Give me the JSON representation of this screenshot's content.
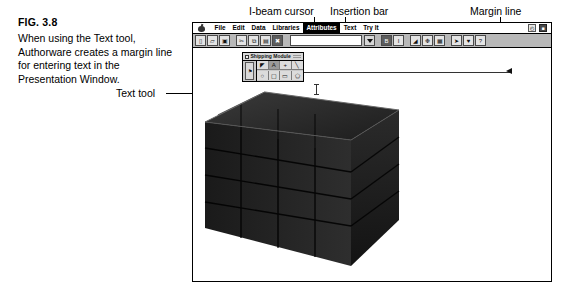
{
  "figure": {
    "label": "FIG. 3.8",
    "caption": "When using the Text tool, Authorware creates a margin line for entering text in the Presentation Window."
  },
  "callouts": {
    "text_tool": "Text tool",
    "ibeam_cursor": "I-beam cursor",
    "insertion_bar": "Insertion bar",
    "margin_line": "Margin line"
  },
  "app": {
    "menus": [
      {
        "label": "File",
        "selected": false
      },
      {
        "label": "Edit",
        "selected": false
      },
      {
        "label": "Data",
        "selected": false
      },
      {
        "label": "Libraries",
        "selected": false
      },
      {
        "label": "Attributes",
        "selected": true
      },
      {
        "label": "Text",
        "selected": false
      },
      {
        "label": "Try It",
        "selected": false
      }
    ],
    "apple_menu_icon": "apple-icon",
    "menu_right_icons": [
      {
        "icon": "clock-icon",
        "glyph": "◴"
      },
      {
        "icon": "screen-icon",
        "glyph": "■"
      }
    ],
    "toolbar": {
      "groups": [
        {
          "name": "file-group",
          "buttons": [
            {
              "icon": "new-document-icon",
              "glyph": "▯",
              "dark": false
            },
            {
              "icon": "open-folder-icon",
              "glyph": "▱",
              "dark": false
            },
            {
              "icon": "save-disk-icon",
              "glyph": "▣",
              "dark": false
            }
          ]
        },
        {
          "name": "edit-group",
          "buttons": [
            {
              "icon": "cut-scissors-icon",
              "glyph": "✂",
              "dark": false
            },
            {
              "icon": "copy-icon",
              "glyph": "⧉",
              "dark": false
            },
            {
              "icon": "paste-icon",
              "glyph": "▤",
              "dark": false
            },
            {
              "icon": "clear-icon",
              "glyph": "✖",
              "dark": true
            }
          ]
        }
      ],
      "font_field": {
        "name": "font-name-field",
        "value": "",
        "placeholder": ""
      },
      "font_dropdown": {
        "icon": "chevron-down-icon"
      },
      "style_buttons": [
        {
          "icon": "bold-icon",
          "glyph": "B",
          "dark": false
        },
        {
          "icon": "italic-icon",
          "glyph": "I",
          "dark": false
        }
      ],
      "object_buttons": [
        {
          "icon": "display-icon",
          "glyph": "◢",
          "dark": false
        },
        {
          "icon": "motion-icon",
          "glyph": "❉",
          "dark": false
        },
        {
          "icon": "video-icon",
          "glyph": "▦",
          "dark": false
        }
      ],
      "run_buttons": [
        {
          "icon": "run-icon",
          "glyph": "➤",
          "dark": false
        },
        {
          "icon": "pause-icon",
          "glyph": "♥",
          "dark": false
        },
        {
          "icon": "help-icon",
          "glyph": "?",
          "dark": false
        }
      ]
    },
    "palette": {
      "title": "Shipping Module",
      "close_box": "close-box",
      "side_icon": "flag-tool-icon",
      "tools": [
        {
          "name": "pointer-tool",
          "glyph": "◤",
          "active": false
        },
        {
          "name": "text-tool",
          "glyph": "A",
          "active": true
        },
        {
          "name": "crosshair-tool",
          "glyph": "+",
          "active": false
        },
        {
          "name": "line-tool",
          "glyph": "╲",
          "active": false
        },
        {
          "name": "ellipse-tool",
          "glyph": "○",
          "active": false
        },
        {
          "name": "rounded-rect-tool",
          "glyph": "▢",
          "active": false
        },
        {
          "name": "rectangle-tool",
          "glyph": "▭",
          "active": false
        },
        {
          "name": "polygon-tool",
          "glyph": "⬠",
          "active": false
        }
      ]
    },
    "presentation": {
      "artwork": "stack-of-crates-photo",
      "margin_line": "margin-line",
      "insertion_marker_left": "left-margin-marker",
      "insertion_marker_right": "right-margin-marker",
      "cursor": "i-beam-cursor"
    }
  }
}
